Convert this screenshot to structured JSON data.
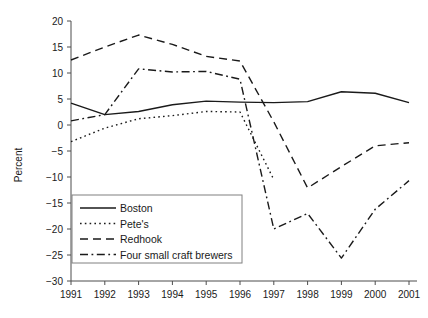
{
  "chart_data": {
    "type": "line",
    "title": "",
    "xlabel": "",
    "ylabel": "Percent",
    "x": [
      1991,
      1992,
      1993,
      1994,
      1995,
      1996,
      1997,
      1998,
      1999,
      2000,
      2001
    ],
    "xtick_labels": [
      "1991",
      "1992",
      "1993",
      "1994",
      "1995",
      "1996",
      "1997",
      "1998",
      "1999",
      "2000",
      "2001"
    ],
    "ytick_labels": [
      "20",
      "15",
      "10",
      "5",
      "0",
      "-5",
      "-10",
      "-15",
      "-20",
      "-25",
      "-30"
    ],
    "ytick_values": [
      20,
      15,
      10,
      5,
      0,
      -5,
      -10,
      -15,
      -20,
      -25,
      -30
    ],
    "ylim": [
      -30,
      20
    ],
    "xlim": [
      1991,
      2001
    ],
    "grid": false,
    "legend_position": "lower-left-inside",
    "series": [
      {
        "name": "Boston",
        "style": "solid",
        "values": [
          4.2,
          2.0,
          2.6,
          3.9,
          4.6,
          4.4,
          4.3,
          4.5,
          6.4,
          6.1,
          4.3
        ]
      },
      {
        "name": "Pete's",
        "style": "dotted",
        "values": [
          -3.2,
          -0.6,
          1.2,
          1.8,
          2.6,
          2.5,
          -10.5,
          null,
          null,
          null,
          null
        ]
      },
      {
        "name": "Redhook",
        "style": "dashed",
        "values": [
          12.5,
          15.0,
          17.3,
          15.5,
          13.2,
          12.3,
          0.6,
          -12.1,
          -8.0,
          -4.0,
          -3.4
        ]
      },
      {
        "name": "Four small craft brewers",
        "style": "dash-dot",
        "values": [
          0.8,
          2.0,
          10.8,
          10.2,
          10.3,
          8.8,
          -20.0,
          -17.0,
          -25.6,
          -16.2,
          -10.7
        ]
      }
    ]
  },
  "legend": {
    "entries": [
      {
        "label": "Boston",
        "style": "solid"
      },
      {
        "label": "Pete's",
        "style": "dotted"
      },
      {
        "label": "Redhook",
        "style": "dashed"
      },
      {
        "label": "Four small craft brewers",
        "style": "dash-dot"
      }
    ]
  },
  "colors": {
    "line": "#1a1a1a",
    "axis": "#4d4d4d",
    "legend_border": "#808080",
    "background": "#ffffff"
  }
}
